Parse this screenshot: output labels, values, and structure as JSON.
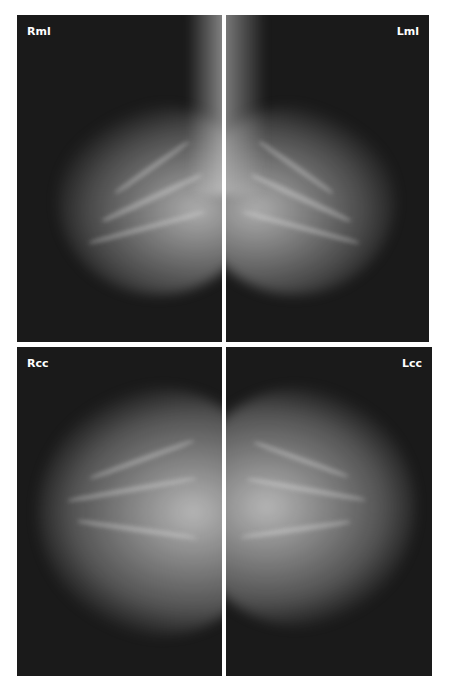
{
  "figure": {
    "panels": [
      {
        "id": "rml",
        "label": "Rml",
        "view": "right mediolateral",
        "position": "top-left"
      },
      {
        "id": "lml",
        "label": "Lml",
        "view": "left mediolateral",
        "position": "top-right"
      },
      {
        "id": "rcc",
        "label": "Rcc",
        "view": "right craniocaudal",
        "position": "bottom-left"
      },
      {
        "id": "lcc",
        "label": "Lcc",
        "view": "left craniocaudal",
        "position": "bottom-right"
      }
    ],
    "colors": {
      "background": "#1a1a1a",
      "tissue": "#d8d8d8",
      "divider": "#ffffff",
      "label": "#ffffff"
    }
  }
}
